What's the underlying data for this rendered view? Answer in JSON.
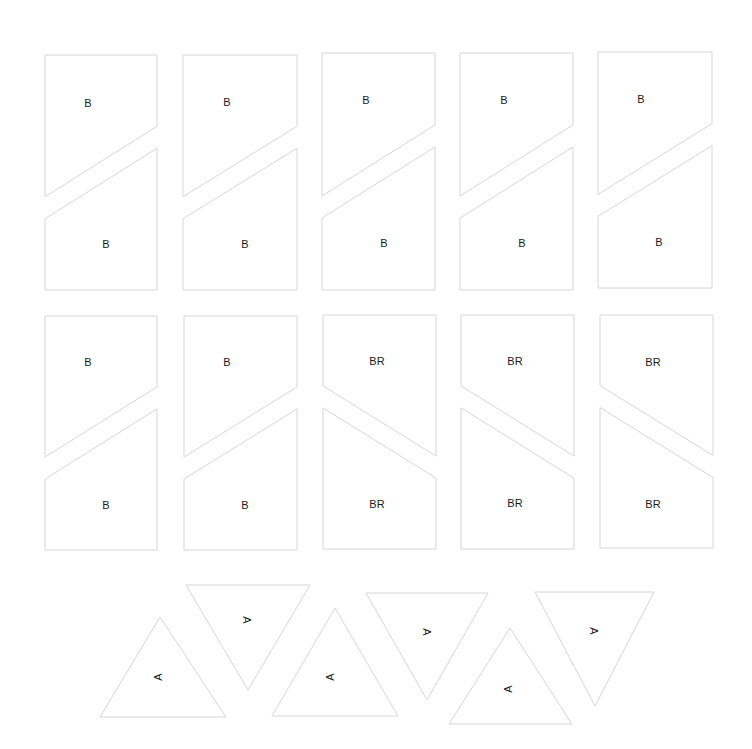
{
  "sheet": {
    "type": "quilt template pattern sheet",
    "background": "#ffffff",
    "outline_color": "#d6d6d6",
    "label_color": "#1a1a1a"
  },
  "rect_pieces": [
    {
      "row": 1,
      "col": 1,
      "x0": 45,
      "x1": 157,
      "y_top": 55,
      "y_bot": 290,
      "orient": "B",
      "top_label": "B",
      "bot_label": "B",
      "top_label_pos": [
        88,
        103
      ],
      "bot_label_pos": [
        106,
        244
      ]
    },
    {
      "row": 1,
      "col": 2,
      "x0": 183,
      "x1": 297,
      "y_top": 55,
      "y_bot": 290,
      "orient": "B",
      "top_label": "B",
      "bot_label": "B",
      "top_label_pos": [
        227,
        102
      ],
      "bot_label_pos": [
        245,
        244
      ]
    },
    {
      "row": 1,
      "col": 3,
      "x0": 322,
      "x1": 435,
      "y_top": 53,
      "y_bot": 290,
      "orient": "B",
      "top_label": "B",
      "bot_label": "B",
      "top_label_pos": [
        366,
        100
      ],
      "bot_label_pos": [
        384,
        243
      ]
    },
    {
      "row": 1,
      "col": 4,
      "x0": 460,
      "x1": 573,
      "y_top": 53,
      "y_bot": 290,
      "orient": "B",
      "top_label": "B",
      "bot_label": "B",
      "top_label_pos": [
        504,
        100
      ],
      "bot_label_pos": [
        522,
        243
      ]
    },
    {
      "row": 1,
      "col": 5,
      "x0": 598,
      "x1": 712,
      "y_top": 52,
      "y_bot": 288,
      "orient": "B",
      "top_label": "B",
      "bot_label": "B",
      "top_label_pos": [
        641,
        99
      ],
      "bot_label_pos": [
        659,
        242
      ]
    },
    {
      "row": 2,
      "col": 1,
      "x0": 45,
      "x1": 157,
      "y_top": 316,
      "y_bot": 550,
      "orient": "B",
      "top_label": "B",
      "bot_label": "B",
      "top_label_pos": [
        88,
        362
      ],
      "bot_label_pos": [
        106,
        505
      ]
    },
    {
      "row": 2,
      "col": 2,
      "x0": 184,
      "x1": 297,
      "y_top": 316,
      "y_bot": 550,
      "orient": "B",
      "top_label": "B",
      "bot_label": "B",
      "top_label_pos": [
        227,
        362
      ],
      "bot_label_pos": [
        245,
        505
      ]
    },
    {
      "row": 2,
      "col": 3,
      "x0": 323,
      "x1": 436,
      "y_top": 315,
      "y_bot": 549,
      "orient": "BR",
      "top_label": "BR",
      "bot_label": "BR",
      "top_label_pos": [
        377,
        361
      ],
      "bot_label_pos": [
        377,
        504
      ]
    },
    {
      "row": 2,
      "col": 4,
      "x0": 461,
      "x1": 574,
      "y_top": 315,
      "y_bot": 549,
      "orient": "BR",
      "top_label": "BR",
      "bot_label": "BR",
      "top_label_pos": [
        515,
        361
      ],
      "bot_label_pos": [
        515,
        503
      ]
    },
    {
      "row": 2,
      "col": 5,
      "x0": 600,
      "x1": 713,
      "y_top": 315,
      "y_bot": 548,
      "orient": "BR",
      "top_label": "BR",
      "bot_label": "BR",
      "top_label_pos": [
        653,
        362
      ],
      "bot_label_pos": [
        653,
        504
      ]
    }
  ],
  "triangles": [
    {
      "dir": "up",
      "points": [
        [
          100,
          717
        ],
        [
          160,
          617
        ],
        [
          226,
          717
        ]
      ],
      "label": "A",
      "label_pos": [
        158,
        677
      ],
      "rotate": -90
    },
    {
      "dir": "down",
      "points": [
        [
          186,
          585
        ],
        [
          310,
          585
        ],
        [
          248,
          690
        ]
      ],
      "label": "A",
      "label_pos": [
        246,
        620
      ],
      "rotate": 90
    },
    {
      "dir": "up",
      "points": [
        [
          272,
          716
        ],
        [
          335,
          608
        ],
        [
          398,
          716
        ]
      ],
      "label": "A",
      "label_pos": [
        330,
        677
      ],
      "rotate": -90
    },
    {
      "dir": "down",
      "points": [
        [
          366,
          593
        ],
        [
          488,
          593
        ],
        [
          427,
          700
        ]
      ],
      "label": "A",
      "label_pos": [
        426,
        632
      ],
      "rotate": 90
    },
    {
      "dir": "up",
      "points": [
        [
          449,
          724
        ],
        [
          510,
          628
        ],
        [
          572,
          724
        ]
      ],
      "label": "A",
      "label_pos": [
        508,
        689
      ],
      "rotate": -90
    },
    {
      "dir": "down",
      "points": [
        [
          535,
          592
        ],
        [
          654,
          592
        ],
        [
          595,
          706
        ]
      ],
      "label": "A",
      "label_pos": [
        593,
        631
      ],
      "rotate": 90
    }
  ]
}
